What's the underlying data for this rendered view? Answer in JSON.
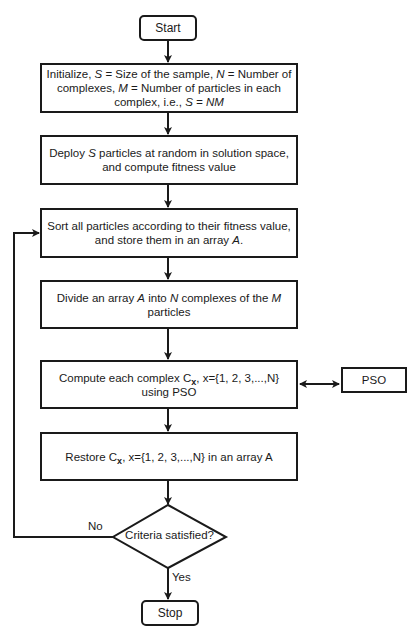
{
  "flowchart": {
    "start": {
      "label": "Start"
    },
    "steps": [
      {
        "id": "init",
        "parts": [
          "Initialize, ",
          "S",
          " = Size of the sample, ",
          "N",
          " = Number of complexes, ",
          "M",
          " = Number of particles in each complex, i.e., ",
          "S = NM"
        ]
      },
      {
        "id": "deploy",
        "parts": [
          "Deploy ",
          "S",
          " particles at random in solution space, and compute fitness value"
        ]
      },
      {
        "id": "sort",
        "parts": [
          "Sort all particles according to their fitness value, and store them in an array ",
          "A",
          "."
        ]
      },
      {
        "id": "divide",
        "parts": [
          "Divide an array ",
          "A",
          " into ",
          "N",
          " complexes of the ",
          "M",
          " particles"
        ]
      },
      {
        "id": "compute",
        "parts": [
          "Compute each complex C",
          "x",
          ", x={1, 2, 3,...,N} using PSO"
        ]
      },
      {
        "id": "restore",
        "parts": [
          "Restore C",
          "x",
          ", x={1, 2, 3,...,N} in an array A"
        ]
      }
    ],
    "side_process": {
      "label": "PSO"
    },
    "decision": {
      "label": "Criteria satisfied?",
      "no_label": "No",
      "yes_label": "Yes"
    },
    "stop": {
      "label": "Stop"
    }
  }
}
